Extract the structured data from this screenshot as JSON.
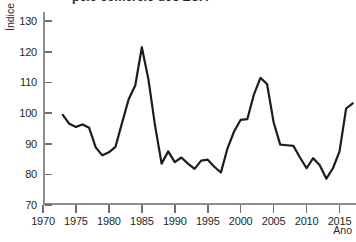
{
  "chart_title": "pelo comércio dos EUA",
  "axes": {
    "ylabel": "Índice",
    "xlabel": "Ano",
    "yticks": [
      70,
      80,
      90,
      100,
      110,
      120,
      130
    ],
    "xticks": [
      1970,
      1975,
      1980,
      1985,
      1990,
      1995,
      2000,
      2005,
      2010,
      2015
    ],
    "ylim": [
      70,
      133
    ],
    "xlim": [
      1970,
      2017.5
    ],
    "grid": false,
    "line_color": "#1c1c1c",
    "axis_color": "#8d8d8d"
  },
  "chart_data": {
    "type": "line",
    "title": "pelo comércio dos EUA",
    "xlabel": "Ano",
    "ylabel": "Índice",
    "ylim": [
      70,
      133
    ],
    "xlim": [
      1970,
      2017.5
    ],
    "grid": false,
    "legend": null,
    "series": [
      {
        "name": "Índice",
        "x": [
          1973,
          1974,
          1975,
          1976,
          1977,
          1978,
          1979,
          1980,
          1981,
          1982,
          1983,
          1984,
          1985,
          1986,
          1987,
          1988,
          1989,
          1990,
          1991,
          1992,
          1993,
          1994,
          1995,
          1996,
          1997,
          1998,
          1999,
          2000,
          2001,
          2002,
          2003,
          2004,
          2005,
          2006,
          2007,
          2008,
          2009,
          2010,
          2011,
          2012,
          2013,
          2014,
          2015,
          2016,
          2017
        ],
        "y": [
          99.4,
          96.5,
          95.5,
          96.3,
          95.2,
          88.8,
          86.2,
          87.2,
          89.0,
          96.8,
          104.5,
          109.0,
          121.5,
          111.0,
          96.0,
          83.5,
          87.5,
          84.0,
          85.5,
          83.5,
          81.8,
          84.5,
          84.8,
          82.5,
          80.6,
          88.5,
          94.0,
          97.8,
          98.0,
          106.0,
          111.5,
          109.5,
          97.0,
          89.7,
          89.5,
          89.3,
          85.5,
          82.0,
          85.3,
          83.0,
          78.6,
          82.0,
          87.5,
          101.5,
          103.2
        ]
      }
    ]
  }
}
